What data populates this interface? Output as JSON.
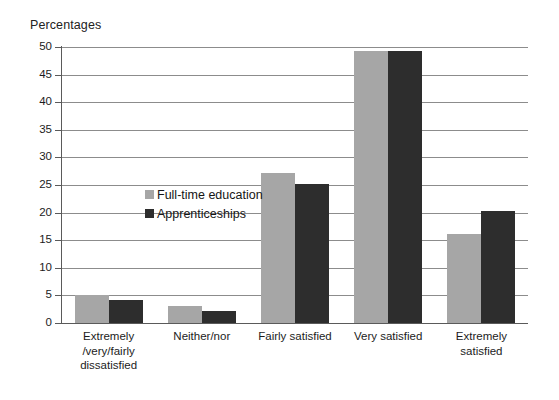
{
  "chart_data": {
    "type": "bar",
    "title": "Percentages",
    "xlabel": "",
    "ylabel": "Percentages",
    "ylim": [
      0,
      50
    ],
    "yticks": [
      0,
      5,
      10,
      15,
      20,
      25,
      30,
      35,
      40,
      45,
      50
    ],
    "grid": true,
    "legend_position": "upper-left-inside",
    "categories": [
      "Extremely\n/very/fairly\ndissatisfied",
      "Neither/nor",
      "Fairly satisfied",
      "Very satisfied",
      "Extremely\nsatisfied"
    ],
    "category_lines": [
      [
        "Extremely",
        "/very/fairly",
        "dissatisfied"
      ],
      [
        "Neither/nor"
      ],
      [
        "Fairly satisfied"
      ],
      [
        "Very satisfied"
      ],
      [
        "Extremely",
        "satisfied"
      ]
    ],
    "series": [
      {
        "name": "Full-time education",
        "color": "#a6a6a6",
        "values": [
          5.0,
          3.0,
          27.2,
          49.2,
          16.1
        ]
      },
      {
        "name": "Apprenticeships",
        "color": "#2d2d2d",
        "values": [
          4.2,
          2.1,
          25.2,
          49.2,
          20.3
        ]
      }
    ]
  },
  "colors": {
    "series_full_time_education": "#a6a6a6",
    "series_apprenticeships": "#2d2d2d",
    "gridline": "#8c8c8c",
    "axis": "#5a5a5a",
    "background": "#ffffff",
    "text": "#1c1c1c"
  }
}
